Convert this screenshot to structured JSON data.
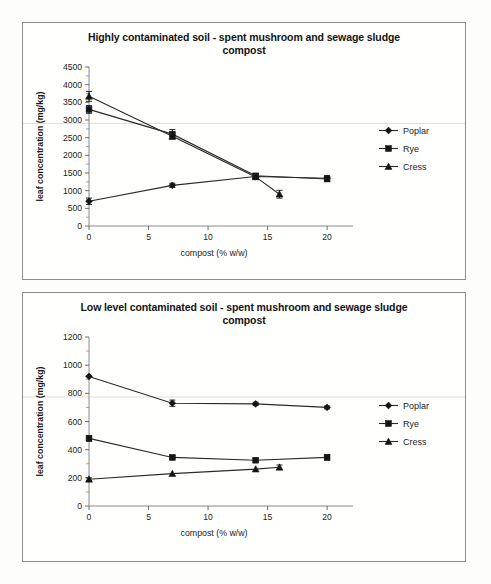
{
  "page": {
    "background": "#fdfdfc",
    "panel_border_color": "#8d8d8d",
    "ink_color": "#1d1d1d"
  },
  "charts": [
    {
      "id": "highly-contaminated",
      "title": "Highly contaminated soil - spent mushroom and sewage sludge compost",
      "title_line1": "Highly contaminated soil - spent mushroom and sewage sludge",
      "title_line2": "compost",
      "xlabel": "compost (% w/w)",
      "ylabel": "leaf concentration (mg/kg)",
      "xticks": [
        "0",
        "5",
        "10",
        "15",
        "20"
      ],
      "yticks": [
        "0",
        "500",
        "1000",
        "1500",
        "2000",
        "2500",
        "3000",
        "3500",
        "4000",
        "4500"
      ],
      "legend": [
        "Poplar",
        "Rye",
        "Cress"
      ]
    },
    {
      "id": "low-level-contaminated",
      "title": "Low level contaminated soil - spent mushroom and sewage sludge compost",
      "title_line1": "Low level contaminated soil - spent mushroom and sewage sludge",
      "title_line2": "compost",
      "xlabel": "compost (% w/w)",
      "ylabel": "leaf concentration (mg/kg)",
      "xticks": [
        "0",
        "5",
        "10",
        "15",
        "20"
      ],
      "yticks": [
        "0",
        "200",
        "400",
        "600",
        "800",
        "1000",
        "1200"
      ],
      "legend": [
        "Poplar",
        "Rye",
        "Cress"
      ]
    }
  ],
  "chart_data": [
    {
      "type": "line",
      "title": "Highly contaminated soil - spent mushroom and sewage sludge compost",
      "xlabel": "compost (% w/w)",
      "ylabel": "leaf concentration (mg/kg)",
      "xlim": [
        0,
        21
      ],
      "ylim": [
        0,
        4500
      ],
      "ytick_step": 500,
      "xtick_step": 5,
      "grid": false,
      "legend_position": "right",
      "error_bars": true,
      "series": [
        {
          "name": "Poplar",
          "marker": "diamond",
          "x": [
            0,
            7,
            14,
            20
          ],
          "values": [
            700,
            1150,
            1400,
            1350
          ],
          "errors": [
            90,
            60,
            70,
            80
          ]
        },
        {
          "name": "Rye",
          "marker": "square",
          "x": [
            0,
            7,
            14,
            20
          ],
          "values": [
            3300,
            2600,
            1420,
            1330
          ],
          "errors": [
            110,
            130,
            60,
            70
          ]
        },
        {
          "name": "Cress",
          "marker": "triangle",
          "x": [
            0,
            7,
            14,
            16
          ],
          "values": [
            3670,
            2540,
            1390,
            900
          ],
          "errors": [
            140,
            80,
            60,
            110
          ]
        }
      ]
    },
    {
      "type": "line",
      "title": "Low level contaminated soil - spent mushroom and sewage sludge compost",
      "xlabel": "compost (% w/w)",
      "ylabel": "leaf concentration (mg/kg)",
      "xlim": [
        0,
        21
      ],
      "ylim": [
        0,
        1200
      ],
      "ytick_step": 200,
      "xtick_step": 5,
      "grid": false,
      "legend_position": "right",
      "error_bars": true,
      "series": [
        {
          "name": "Poplar",
          "marker": "diamond",
          "x": [
            0,
            7,
            14,
            20
          ],
          "values": [
            920,
            730,
            725,
            700
          ],
          "errors": [
            0,
            22,
            12,
            10
          ]
        },
        {
          "name": "Rye",
          "marker": "square",
          "x": [
            0,
            7,
            14,
            20
          ],
          "values": [
            480,
            345,
            325,
            345
          ],
          "errors": [
            18,
            12,
            14,
            18
          ]
        },
        {
          "name": "Cress",
          "marker": "triangle",
          "x": [
            0,
            7,
            14,
            16
          ],
          "values": [
            190,
            230,
            262,
            275
          ],
          "errors": [
            10,
            0,
            0,
            16
          ]
        }
      ]
    }
  ]
}
